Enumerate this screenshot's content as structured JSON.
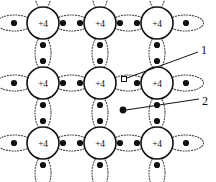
{
  "figure": {
    "width": 216,
    "height": 182,
    "background": "#ffffff",
    "ink_color": "#111111",
    "bond_color": "#444444"
  },
  "lattice": {
    "rows": 3,
    "columns": 3,
    "core_charge_label": "+4",
    "core_radius": 16,
    "column_x": [
      43,
      100,
      157
    ],
    "row_y": [
      23,
      83,
      143
    ],
    "atoms": [
      {
        "id": "atom-r1c1",
        "row": 1,
        "col": 1,
        "cx": 43,
        "cy": 23,
        "label": "+4"
      },
      {
        "id": "atom-r1c2",
        "row": 1,
        "col": 2,
        "cx": 100,
        "cy": 23,
        "label": "+4"
      },
      {
        "id": "atom-r1c3",
        "row": 1,
        "col": 3,
        "cx": 157,
        "cy": 23,
        "label": "+4"
      },
      {
        "id": "atom-r2c1",
        "row": 2,
        "col": 1,
        "cx": 43,
        "cy": 83,
        "label": "+4"
      },
      {
        "id": "atom-r2c2",
        "row": 2,
        "col": 2,
        "cx": 100,
        "cy": 83,
        "label": "+4"
      },
      {
        "id": "atom-r2c3",
        "row": 2,
        "col": 3,
        "cx": 157,
        "cy": 83,
        "label": "+4"
      },
      {
        "id": "atom-r3c1",
        "row": 3,
        "col": 1,
        "cx": 43,
        "cy": 143,
        "label": "+4"
      },
      {
        "id": "atom-r3c2",
        "row": 3,
        "col": 2,
        "cx": 100,
        "cy": 143,
        "label": "+4"
      },
      {
        "id": "atom-r3c3",
        "row": 3,
        "col": 3,
        "cx": 157,
        "cy": 143,
        "label": "+4"
      }
    ],
    "horizontal_bonds": [
      {
        "id": "hbond-r1-c1c2",
        "cx": 71.5,
        "cy": 23,
        "rx": 18,
        "ry": 8,
        "electrons": [
          {
            "x": 63,
            "y": 23
          },
          {
            "x": 80,
            "y": 23
          }
        ]
      },
      {
        "id": "hbond-r1-c2c3",
        "cx": 128.5,
        "cy": 23,
        "rx": 18,
        "ry": 8,
        "electrons": [
          {
            "x": 120,
            "y": 23
          },
          {
            "x": 137,
            "y": 23
          }
        ]
      },
      {
        "id": "hbond-r2-c1c2",
        "cx": 71.5,
        "cy": 83,
        "rx": 18,
        "ry": 8,
        "electrons": [
          {
            "x": 63,
            "y": 83
          },
          {
            "x": 80,
            "y": 83
          }
        ]
      },
      {
        "id": "hbond-r2-c2c3",
        "cx": 128.5,
        "cy": 83,
        "rx": 18,
        "ry": 8,
        "electrons": [
          {
            "x": 137,
            "y": 83
          }
        ]
      },
      {
        "id": "hbond-r3-c1c2",
        "cx": 71.5,
        "cy": 143,
        "rx": 18,
        "ry": 8,
        "electrons": [
          {
            "x": 63,
            "y": 143
          },
          {
            "x": 80,
            "y": 143
          }
        ]
      },
      {
        "id": "hbond-r3-c2c3",
        "cx": 128.5,
        "cy": 143,
        "rx": 18,
        "ry": 8,
        "electrons": [
          {
            "x": 120,
            "y": 143
          },
          {
            "x": 137,
            "y": 143
          }
        ]
      }
    ],
    "vertical_bonds": [
      {
        "id": "vbond-c1-r1r2",
        "cx": 43,
        "cy": 53,
        "rx": 8,
        "ry": 17,
        "electrons": [
          {
            "x": 43,
            "y": 45
          },
          {
            "x": 43,
            "y": 61
          }
        ]
      },
      {
        "id": "vbond-c2-r1r2",
        "cx": 100,
        "cy": 53,
        "rx": 8,
        "ry": 17,
        "electrons": [
          {
            "x": 100,
            "y": 45
          },
          {
            "x": 100,
            "y": 61
          }
        ]
      },
      {
        "id": "vbond-c3-r1r2",
        "cx": 157,
        "cy": 53,
        "rx": 8,
        "ry": 17,
        "electrons": [
          {
            "x": 157,
            "y": 45
          },
          {
            "x": 157,
            "y": 61
          }
        ]
      },
      {
        "id": "vbond-c1-r2r3",
        "cx": 43,
        "cy": 113,
        "rx": 8,
        "ry": 17,
        "electrons": [
          {
            "x": 43,
            "y": 105
          },
          {
            "x": 43,
            "y": 121
          }
        ]
      },
      {
        "id": "vbond-c2-r2r3",
        "cx": 100,
        "cy": 113,
        "rx": 8,
        "ry": 17,
        "electrons": [
          {
            "x": 100,
            "y": 105
          },
          {
            "x": 100,
            "y": 121
          }
        ]
      },
      {
        "id": "vbond-c3-r2r3",
        "cx": 157,
        "cy": 113,
        "rx": 8,
        "ry": 17,
        "electrons": [
          {
            "x": 157,
            "y": 105
          },
          {
            "x": 157,
            "y": 121
          }
        ]
      }
    ],
    "edge_bonds": [
      {
        "id": "edge-left-r1",
        "cx": 14.5,
        "cy": 23,
        "rx": 18,
        "ry": 8,
        "electrons": [
          {
            "x": 14,
            "y": 23
          }
        ]
      },
      {
        "id": "edge-left-r2",
        "cx": 14.5,
        "cy": 83,
        "rx": 18,
        "ry": 8,
        "electrons": [
          {
            "x": 14,
            "y": 83
          }
        ]
      },
      {
        "id": "edge-left-r3",
        "cx": 14.5,
        "cy": 143,
        "rx": 18,
        "ry": 8,
        "electrons": [
          {
            "x": 14,
            "y": 143
          }
        ]
      },
      {
        "id": "edge-right-r1",
        "cx": 185.5,
        "cy": 23,
        "rx": 18,
        "ry": 8,
        "electrons": [
          {
            "x": 186,
            "y": 23
          }
        ]
      },
      {
        "id": "edge-right-r2",
        "cx": 185.5,
        "cy": 83,
        "rx": 18,
        "ry": 8,
        "electrons": [
          {
            "x": 186,
            "y": 83
          }
        ]
      },
      {
        "id": "edge-right-r3",
        "cx": 185.5,
        "cy": 143,
        "rx": 18,
        "ry": 8,
        "electrons": [
          {
            "x": 186,
            "y": 143
          }
        ]
      },
      {
        "id": "edge-top-c1",
        "cx": 43,
        "cy": -7,
        "rx": 8,
        "ry": 17,
        "electrons": []
      },
      {
        "id": "edge-top-c2",
        "cx": 100,
        "cy": -7,
        "rx": 8,
        "ry": 17,
        "electrons": []
      },
      {
        "id": "edge-top-c3",
        "cx": 157,
        "cy": -7,
        "rx": 8,
        "ry": 17,
        "electrons": []
      },
      {
        "id": "edge-bottom-c1",
        "cx": 43,
        "cy": 173,
        "rx": 8,
        "ry": 17,
        "electrons": [
          {
            "x": 43,
            "y": 165
          }
        ]
      },
      {
        "id": "edge-bottom-c2",
        "cx": 100,
        "cy": 173,
        "rx": 8,
        "ry": 17,
        "electrons": [
          {
            "x": 100,
            "y": 165
          }
        ]
      },
      {
        "id": "edge-bottom-c3",
        "cx": 157,
        "cy": 173,
        "rx": 8,
        "ry": 17,
        "electrons": [
          {
            "x": 157,
            "y": 165
          }
        ]
      }
    ]
  },
  "defects": {
    "hole": {
      "id": "hole-marker",
      "shape": "open-square",
      "x": 124,
      "y": 79,
      "size": 5
    },
    "free_electron": {
      "id": "free-electron-marker",
      "shape": "filled-circle",
      "x": 123,
      "y": 110,
      "radius": 3.4
    }
  },
  "callouts": [
    {
      "id": "callout-1",
      "label": "1",
      "label_x": 204,
      "label_y": 50,
      "line_from_x": 127,
      "line_from_y": 78,
      "line_to_x": 198,
      "line_to_y": 52,
      "target": "hole"
    },
    {
      "id": "callout-2",
      "label": "2",
      "label_x": 205,
      "label_y": 101,
      "line_from_x": 126,
      "line_from_y": 110,
      "line_to_x": 199,
      "line_to_y": 99,
      "target": "free-electron"
    }
  ]
}
